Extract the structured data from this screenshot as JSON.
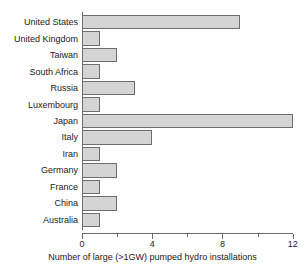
{
  "chart_data": {
    "type": "bar",
    "orientation": "horizontal",
    "title": "",
    "subtitle": "",
    "xlabel": "Number of large (>1GW) pumped hydro installations",
    "ylabel": "",
    "categories": [
      "United States",
      "United Kingdom",
      "Taiwan",
      "South Africa",
      "Russia",
      "Luxembourg",
      "Japan",
      "Italy",
      "Iran",
      "Germany",
      "France",
      "China",
      "Australia"
    ],
    "values": [
      9,
      1,
      2,
      1,
      3,
      1,
      12,
      4,
      1,
      2,
      1,
      2,
      1
    ],
    "xlim": [
      0,
      12.3
    ],
    "xticks": [
      0,
      2,
      4,
      6,
      8,
      10,
      12
    ],
    "xtick_labels": [
      "0",
      "",
      "4",
      "",
      "8",
      "",
      "12"
    ],
    "major_ticks": [
      0,
      4,
      8,
      12
    ],
    "minor_ticks": [
      2,
      6,
      10
    ],
    "grid": false,
    "legend": null,
    "bar_fill_color": "#d4d4d4",
    "bar_edge_color": "#6e6e6e",
    "axis_color": "#6b6b6b",
    "background_color": "#ffffff",
    "text_color": "#1a1a1a"
  }
}
